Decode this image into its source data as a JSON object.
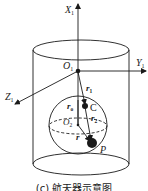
{
  "figure": {
    "caption": "(c) 航天器示意图",
    "labels": {
      "x_axis": "X",
      "x_axis_sub": "1",
      "y_axis": "Y",
      "y_axis_sub": "1",
      "z_axis": "Z",
      "z_axis_sub": "1",
      "origin1": "O",
      "origin1_sub": "1",
      "origin2": "O",
      "origin2_sub": "2",
      "r1": "r",
      "r1_sub": "1",
      "r2": "r",
      "r2_sub": "2",
      "r0": "r",
      "r0_sub": "o",
      "r": "r",
      "point_c": "C",
      "point_p": "P"
    },
    "colors": {
      "stroke": "#1a1a1a",
      "background": "#ffffff"
    }
  }
}
